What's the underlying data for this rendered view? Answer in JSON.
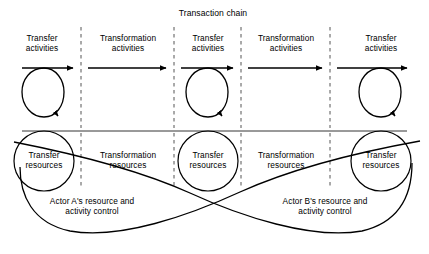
{
  "figure": {
    "title": "Transaction chain",
    "background_color": "#ffffff",
    "line_color": "#000000",
    "divider_color": "#555555"
  },
  "activities_row": {
    "columns": [
      {
        "label": "Transfer\nactivities",
        "kind": "transfer",
        "has_loop": true
      },
      {
        "label": "Transformation\nactivities",
        "kind": "transformation",
        "has_loop": false
      },
      {
        "label": "Transfer\nactivities",
        "kind": "transfer",
        "has_loop": true
      },
      {
        "label": "Transformation\nactivities",
        "kind": "transformation",
        "has_loop": false
      },
      {
        "label": "Transfer\nactivities",
        "kind": "transfer",
        "has_loop": true
      }
    ]
  },
  "resources_row": {
    "columns": [
      {
        "label": "Transfer\nresources",
        "kind": "transfer",
        "has_circle": true
      },
      {
        "label": "Transformation\nresources",
        "kind": "transformation",
        "has_circle": false
      },
      {
        "label": "Transfer\nresources",
        "kind": "transfer",
        "has_circle": true
      },
      {
        "label": "Transformation\nresources",
        "kind": "transformation",
        "has_circle": false
      },
      {
        "label": "Transfer\nresources",
        "kind": "transfer",
        "has_circle": true
      }
    ]
  },
  "control_spans": [
    {
      "id": "actor-a",
      "label": "Actor A's resource and\nactivity control"
    },
    {
      "id": "actor-b",
      "label": "Actor B's resource and\nactivity control"
    }
  ]
}
